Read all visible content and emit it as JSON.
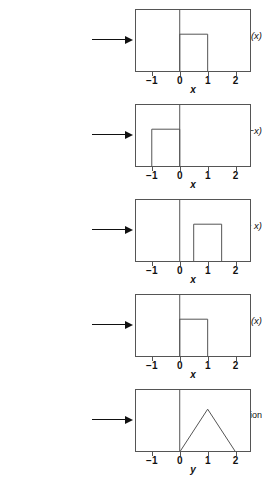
{
  "figure": {
    "panel_count": 5,
    "axis_min": -1.6,
    "axis_max": 2.55,
    "ticks": [
      {
        "value": -1,
        "label": "−1"
      },
      {
        "value": 0,
        "label": "0"
      },
      {
        "value": 1,
        "label": "1"
      },
      {
        "value": 2,
        "label": "2"
      }
    ],
    "stroke_color": "#555555",
    "text_color": "#111111",
    "background": "#ffffff"
  },
  "panels": [
    {
      "id": "panel-f2-x",
      "label_html": "f2(x)",
      "label_main": "f",
      "label_sub": "2",
      "label_rest": "(x)",
      "axis_label": "x",
      "top": 0,
      "chart": {
        "type": "line",
        "shape": "rect",
        "x_start": 0,
        "x_end": 1,
        "height": 0.6,
        "points": [
          [
            0,
            0
          ],
          [
            0,
            0.6
          ],
          [
            1,
            0.6
          ],
          [
            1,
            0
          ]
        ]
      }
    },
    {
      "id": "panel-f2-neg-x",
      "label_html": "f2(−x)",
      "label_main": "f",
      "label_sub": "2",
      "label_rest": "(−x)",
      "axis_label": "x",
      "top": 95,
      "chart": {
        "type": "line",
        "shape": "rect",
        "x_start": -1,
        "x_end": 0,
        "height": 0.6,
        "points": [
          [
            -1,
            0
          ],
          [
            -1,
            0.6
          ],
          [
            0,
            0.6
          ],
          [
            0,
            0
          ]
        ]
      }
    },
    {
      "id": "panel-f2-y-minus-x",
      "label_html": "f2(y − x)",
      "label_main": "f",
      "label_sub": "2",
      "label_rest": "(y − x)",
      "axis_label": "x",
      "top": 190,
      "chart": {
        "type": "line",
        "shape": "rect",
        "x_start": 0.5,
        "x_end": 1.5,
        "height": 0.6,
        "points": [
          [
            0.5,
            0
          ],
          [
            0.5,
            0.6
          ],
          [
            1.5,
            0.6
          ],
          [
            1.5,
            0
          ]
        ]
      }
    },
    {
      "id": "panel-f1-x",
      "label_html": "f1(x)",
      "label_main": "f",
      "label_sub": "1",
      "label_rest": "(x)",
      "axis_label": "x",
      "top": 285,
      "chart": {
        "type": "line",
        "shape": "rect",
        "x_start": 0,
        "x_end": 1,
        "height": 0.6,
        "points": [
          [
            0,
            0
          ],
          [
            0,
            0.6
          ],
          [
            1,
            0.6
          ],
          [
            1,
            0
          ]
        ]
      }
    },
    {
      "id": "panel-convolution",
      "label_html": "Convolution",
      "label_main": "Convolution",
      "label_sub": "",
      "label_rest": "",
      "axis_label": "y",
      "top": 380,
      "chart": {
        "type": "line",
        "shape": "triangle",
        "x_start": 0,
        "x_end": 2,
        "peak_x": 1,
        "height": 0.68,
        "points": [
          [
            0,
            0
          ],
          [
            1,
            0.68
          ],
          [
            2,
            0
          ]
        ]
      }
    }
  ],
  "chart_data": {
    "type": "line",
    "xlabel": "x (panels 1–4), y (panel 5)",
    "ylabel": "",
    "xlim": [
      -1.6,
      2.55
    ],
    "ylim": [
      0,
      1
    ],
    "grid": false,
    "legend": "none",
    "series": [
      {
        "name": "f2(x)",
        "shape": "rect",
        "x": [
          0,
          0,
          1,
          1
        ],
        "values": [
          0,
          0.6,
          0.6,
          0
        ]
      },
      {
        "name": "f2(-x)",
        "shape": "rect",
        "x": [
          -1,
          -1,
          0,
          0
        ],
        "values": [
          0,
          0.6,
          0.6,
          0
        ]
      },
      {
        "name": "f2(y - x)",
        "shape": "rect",
        "x": [
          0.5,
          0.5,
          1.5,
          1.5
        ],
        "values": [
          0,
          0.6,
          0.6,
          0
        ]
      },
      {
        "name": "f1(x)",
        "shape": "rect",
        "x": [
          0,
          0,
          1,
          1
        ],
        "values": [
          0,
          0.6,
          0.6,
          0
        ]
      },
      {
        "name": "Convolution",
        "shape": "triangle",
        "x": [
          0,
          1,
          2
        ],
        "values": [
          0,
          0.68,
          0
        ]
      }
    ],
    "tick_labels": [
      "−1",
      "0",
      "1",
      "2"
    ],
    "tick_values": [
      -1,
      0,
      1,
      2
    ]
  }
}
